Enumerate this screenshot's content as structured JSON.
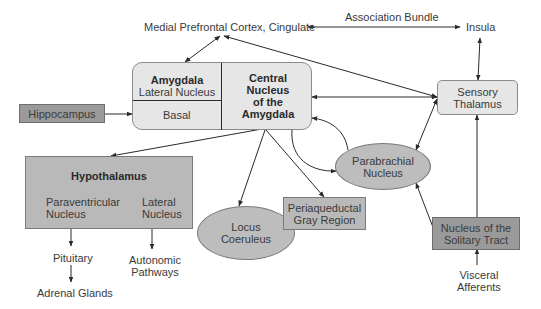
{
  "diagram": {
    "top_labels": {
      "medial_prefrontal": "Medial Prefrontal Cortex, Cingulate",
      "association_bundle": "Association Bundle",
      "insula": "Insula"
    },
    "amygdala": {
      "title": "Amygdala",
      "lateral": "Lateral Nucleus",
      "basal": "Basal",
      "central_line1": "Central",
      "central_line2": "Nucleus",
      "central_line3": "of the",
      "central_line4": "Amygdala"
    },
    "hippocampus": "Hippocampus",
    "sensory_thalamus": {
      "line1": "Sensory",
      "line2": "Thalamus"
    },
    "hypothalamus": {
      "title": "Hypothalamus",
      "paraventricular_line1": "Paraventricular",
      "paraventricular_line2": "Nucleus",
      "lateral_line1": "Lateral",
      "lateral_line2": "Nucleus"
    },
    "locus_coeruleus": {
      "line1": "Locus",
      "line2": "Coeruleus"
    },
    "periaqueductal": {
      "line1": "Periaqueductal",
      "line2": "Gray Region"
    },
    "parabrachial": {
      "line1": "Parabrachial",
      "line2": "Nucleus"
    },
    "nts": {
      "line1": "Nucleus of the",
      "line2": "Solitary Tract"
    },
    "outputs": {
      "pituitary": "Pituitary",
      "adrenal": "Adrenal Glands",
      "autonomic_line1": "Autonomic",
      "autonomic_line2": "Pathways",
      "visceral_line1": "Visceral",
      "visceral_line2": "Afferents"
    },
    "colors": {
      "light_box": "#e6e6e6",
      "dark_box": "#9a9a9a",
      "mid_box": "#b9b9b9",
      "oval": "#bdbdbd",
      "line": "#2a2a2a"
    }
  }
}
